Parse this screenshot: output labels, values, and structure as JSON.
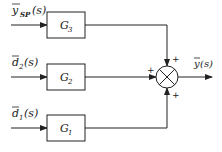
{
  "diagram": {
    "type": "block-diagram",
    "inputs": [
      {
        "id": "ysp",
        "label_main": "y",
        "label_sub": "SP",
        "label_tail": "(s)",
        "block": "G3"
      },
      {
        "id": "d2",
        "label_main": "d",
        "label_sub": "2",
        "label_tail": "(s)",
        "block": "G2"
      },
      {
        "id": "d1",
        "label_main": "d",
        "label_sub": "1",
        "label_tail": "(s)",
        "block": "G1"
      }
    ],
    "blocks": [
      {
        "id": "G3",
        "main": "G",
        "sub": "3"
      },
      {
        "id": "G2",
        "main": "G",
        "sub": "2"
      },
      {
        "id": "G1",
        "main": "G",
        "sub": "1"
      }
    ],
    "summing_junction": {
      "signs": {
        "top": "+",
        "left": "+",
        "bottom": "+"
      }
    },
    "output": {
      "label_main": "y",
      "label_tail": "(s)"
    }
  }
}
